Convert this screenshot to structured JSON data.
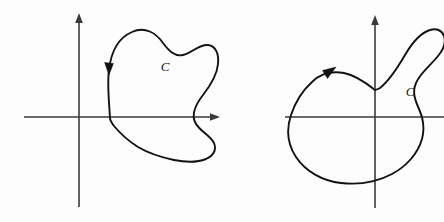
{
  "figure": {
    "background_color": "#fdfdfd",
    "axis_color": "#3a3a3a",
    "curve_color": "#121212",
    "label_color": "#1a1a1a",
    "panel_count": 2
  },
  "panels": [
    {
      "id": "left",
      "caption": "",
      "curve_label": "C",
      "label_position": {
        "x": 165,
        "y": 68
      },
      "orientation": "clockwise",
      "arrow_direction": "down",
      "arrow_position": {
        "x": 109,
        "y": 66
      },
      "axes": {
        "origin": {
          "x": 79,
          "y": 117
        },
        "x_axis": {
          "start": 24,
          "end": 220,
          "y": 117,
          "arrowhead": "right"
        },
        "y_axis": {
          "top": 13,
          "bottom": 207,
          "x": 79,
          "arrowhead": "up"
        }
      },
      "curve_path": "M 110 118 C 109 100 107 84 109 70 C 111 52 118 38 132 32 C 145 26 156 33 163 43 C 169 51 175 57 183 55 C 192 53 199 44 208 45 C 216 46 219 54 218 64 C 217 76 210 86 203 95 C 196 104 191 113 195 122 C 199 131 210 135 214 143 C 217 150 213 156 206 159 C 196 163 184 162 174 160 C 160 157 148 153 138 147 C 127 140 119 132 114 126 C 111 122 110 120 110 118 Z"
    },
    {
      "id": "right",
      "caption": "",
      "curve_label": "C",
      "label_position": {
        "x": 188,
        "y": 93
      },
      "orientation": "counterclockwise",
      "arrow_direction": "up-right",
      "arrow_position": {
        "x": 105,
        "y": 72
      },
      "axes": {
        "origin": {
          "x": 153,
          "y": 117
        },
        "x_axis": {
          "start": 63,
          "end": 222,
          "y": 117,
          "arrowhead": "none"
        },
        "y_axis": {
          "top": 15,
          "bottom": 208,
          "x": 153,
          "arrowhead": "up"
        }
      },
      "curve_path": "M 153 90 C 143 82 133 75 122 73 C 110 71 98 74 90 82 C 80 91 73 103 69 115 C 64 130 66 145 74 157 C 84 172 101 181 119 183 C 137 185 155 182 170 174 C 185 166 196 153 200 139 C 203 128 201 118 197 109 C 193 100 190 92 194 83 C 198 73 208 66 216 56 C 222 49 224 42 222 36 C 220 30 214 28 208 30 C 198 33 190 43 183 55 C 176 67 168 80 158 88 C 156 89 154 90 153 90 Z"
    }
  ],
  "icons": {
    "axis_arrow": "arrowhead-icon",
    "direction_marker": "direction-arrow-icon"
  }
}
